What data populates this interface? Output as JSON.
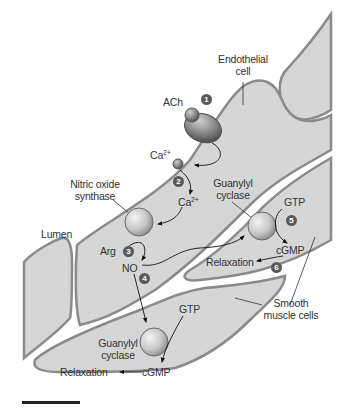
{
  "diagram": {
    "colors": {
      "cell_fill": "#d6d6d6",
      "cell_outline": "#8a8a8a",
      "background": "#ffffff",
      "badge": "#5a5a5a",
      "text": "#333333"
    },
    "labels": {
      "endothelial_cell_line1": "Endothelial",
      "endothelial_cell_line2": "cell",
      "ach": "ACh",
      "ca_top": "Ca",
      "ca_top_sup": "2+",
      "ca_mid": "Ca",
      "ca_mid_sup": "2+",
      "nos_line1": "Nitric oxide",
      "nos_line2": "synthase",
      "lumen": "Lumen",
      "arg": "Arg",
      "no": "NO",
      "gc_upper_line1": "Guanylyl",
      "gc_upper_line2": "cyclase",
      "gtp_upper": "GTP",
      "cgmp_upper": "cGMP",
      "relaxation_upper": "Relaxation",
      "smooth_line1": "Smooth",
      "smooth_line2": "muscle cells",
      "gtp_lower": "GTP",
      "gc_lower_line1": "Guanylyl",
      "gc_lower_line2": "cyclase",
      "cgmp_lower": "cGMP",
      "relaxation_lower": "Relaxation"
    },
    "steps": [
      "1",
      "2",
      "3",
      "4",
      "5",
      "6"
    ]
  }
}
